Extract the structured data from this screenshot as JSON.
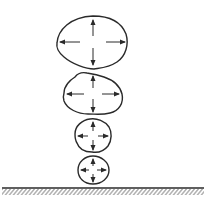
{
  "diagram": {
    "stroke_color": "#2a2a2a",
    "background": "#ffffff",
    "drops": [
      {
        "id": "drop-1",
        "cx": 91,
        "cy": 42,
        "rx": 36,
        "ry": 27,
        "arrows": [
          "up",
          "down",
          "left",
          "right"
        ]
      },
      {
        "id": "drop-2",
        "cx": 93,
        "cy": 94,
        "rx": 30,
        "ry": 22,
        "arrows": [
          "up",
          "down",
          "left",
          "right"
        ]
      },
      {
        "id": "drop-3",
        "cx": 93,
        "cy": 136,
        "rx": 19,
        "ry": 17,
        "arrows": [
          "up",
          "down",
          "left",
          "right"
        ]
      },
      {
        "id": "drop-4",
        "cx": 93,
        "cy": 170,
        "rx": 16,
        "ry": 15,
        "arrows": [
          "up",
          "down",
          "left",
          "right"
        ]
      }
    ],
    "ground": {
      "y": 188,
      "x_start": 2,
      "x_end": 204,
      "hatched": true
    }
  }
}
